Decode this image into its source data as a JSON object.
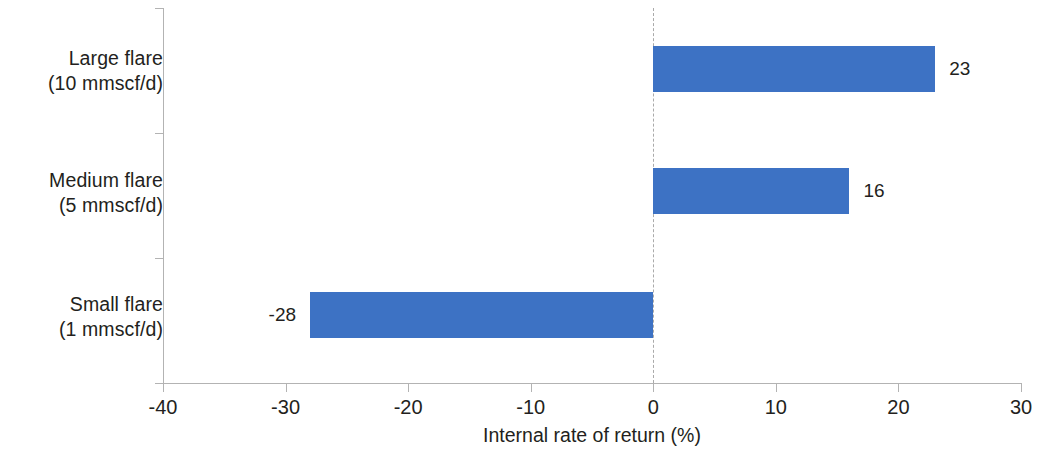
{
  "chart_data": {
    "type": "bar",
    "orientation": "horizontal",
    "title": "",
    "subtitle": "",
    "xlabel": "Internal rate of return (%)",
    "ylabel": "",
    "categories": [
      "Large flare (10 mmscf/d)",
      "Medium flare (5 mmscf/d)",
      "Small flare (1 mmscf/d)"
    ],
    "category_lines": [
      [
        "Large flare",
        "(10 mmscf/d)"
      ],
      [
        "Medium flare",
        "(5 mmscf/d)"
      ],
      [
        "Small flare",
        "(1 mmscf/d)"
      ]
    ],
    "values": [
      23,
      16,
      -28
    ],
    "value_labels": [
      "23",
      "16",
      "-28"
    ],
    "xlim": [
      -40,
      30
    ],
    "xticks": [
      -40,
      -30,
      -20,
      -10,
      0,
      10,
      20,
      30
    ],
    "xtick_labels": [
      "-40",
      "-30",
      "-20",
      "-10",
      "0",
      "10",
      "20",
      "30"
    ],
    "grid": false,
    "zero_reference_line": true,
    "legend": null,
    "bar_color": "#3d72c4",
    "axis_color": "#b3b3b3",
    "zero_line_color": "#aaaaaa",
    "text_color": "#231f20"
  }
}
